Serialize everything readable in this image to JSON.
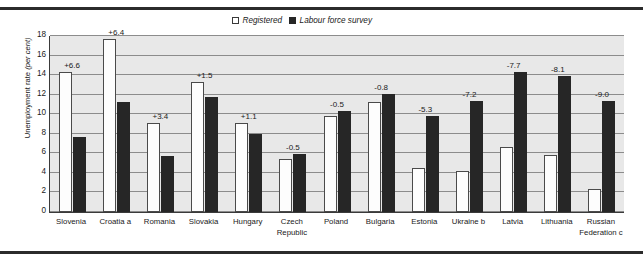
{
  "chart_data": {
    "type": "bar",
    "title": "",
    "xlabel": "",
    "ylabel": "Unemployment rate (per cent)",
    "ylabel_plain": "Unemployment rate ",
    "ylabel_italic": "(per cent)",
    "ylim": [
      0,
      18
    ],
    "ytick_step": 2,
    "yticks": [
      "0",
      "2",
      "4",
      "6",
      "8",
      "10",
      "12",
      "14",
      "16",
      "18"
    ],
    "grid": true,
    "legend_position": "top-center",
    "categories": [
      "Slovenia",
      "Croatia a",
      "Romania",
      "Slovakia",
      "Hungary",
      "Czech\nRepublic",
      "Poland",
      "Bulgaria",
      "Estonia",
      "Ukraine b",
      "Latvia",
      "Lithuania",
      "Russian\nFederation c"
    ],
    "series": [
      {
        "name": "Registered",
        "color": "#ffffff",
        "values": [
          14.3,
          17.7,
          9.1,
          13.3,
          9.1,
          5.4,
          9.8,
          11.3,
          4.5,
          4.2,
          6.6,
          5.8,
          2.4
        ]
      },
      {
        "name": "Labour force survey",
        "color": "#262626",
        "values": [
          7.7,
          11.3,
          5.7,
          11.8,
          8.0,
          5.9,
          10.3,
          12.1,
          9.8,
          11.4,
          14.3,
          13.9,
          11.4
        ]
      }
    ],
    "annotations": [
      "+6.6",
      "+6.4",
      "+3.4",
      "+1.5",
      "+1.1",
      "-0.5",
      "-0.5",
      "-0.8",
      "-5.3",
      "-7.2",
      "-7.7",
      "-8.1",
      "-9.0"
    ]
  },
  "legend": {
    "items": [
      {
        "label": "Registered",
        "swatch": "registered"
      },
      {
        "label": "Labour force survey",
        "swatch": "lfs"
      }
    ]
  }
}
